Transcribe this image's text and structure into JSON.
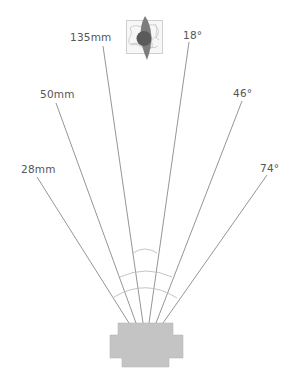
{
  "diagram": {
    "colors": {
      "ray": "#7a7a7a",
      "arc": "#bdbdbd",
      "label": "#555555",
      "camera_body": "#c4c4c4",
      "subject_dark": "#5a5a5a",
      "subject_mid": "#7d7d7d",
      "subject_frame": "#cfcfcf"
    },
    "focal_lengths": [
      {
        "label": "28mm",
        "angle_label": "74°"
      },
      {
        "label": "50mm",
        "angle_label": "46°"
      },
      {
        "label": "135mm",
        "angle_label": "18°"
      }
    ],
    "labels": {
      "left_135": "135mm",
      "left_50": "50mm",
      "left_28": "28mm",
      "right_18": "18°",
      "right_46": "46°",
      "right_74": "74°"
    },
    "subject_icon": "subject-figure-icon",
    "camera_icon": "camera-body-icon"
  }
}
